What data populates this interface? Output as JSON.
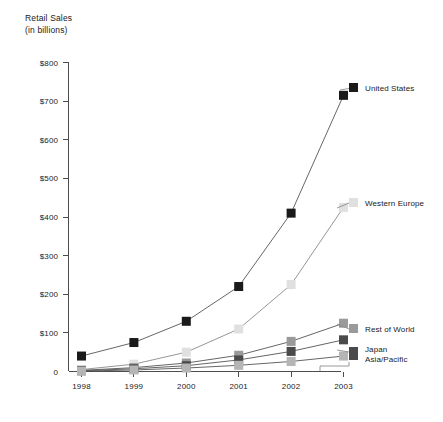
{
  "chart_data": {
    "type": "line",
    "title": "Retail Sales",
    "subtitle": "(in billions)",
    "xlabel": "",
    "ylabel": "Retail Sales (in billions)",
    "x": [
      "1998",
      "1999",
      "2000",
      "2001",
      "2002",
      "2003"
    ],
    "categories": [
      "1998",
      "1999",
      "2000",
      "2001",
      "2002",
      "2003"
    ],
    "ylim": [
      0,
      800
    ],
    "yticks": [
      0,
      100,
      200,
      300,
      400,
      500,
      600,
      700,
      800
    ],
    "ytick_labels": [
      "0",
      "$100",
      "$200",
      "$300",
      "$400",
      "$500",
      "$600",
      "$700",
      "$800"
    ],
    "grid": false,
    "legend_position": "right-inline-labels",
    "series": [
      {
        "name": "United States",
        "color": "#1a1a1a",
        "marker": "square",
        "values": [
          40,
          75,
          130,
          220,
          410,
          715
        ]
      },
      {
        "name": "Western Europe",
        "color": "#e0e0e0",
        "marker": "square",
        "values": [
          5,
          19,
          50,
          110,
          225,
          425
        ]
      },
      {
        "name": "Rest of World",
        "color": "#9a9a9a",
        "marker": "square",
        "values": [
          3,
          10,
          22,
          42,
          78,
          125
        ]
      },
      {
        "name": "Japan",
        "color": "#4a4a4a",
        "marker": "square",
        "values": [
          2,
          7,
          15,
          30,
          52,
          82
        ]
      },
      {
        "name": "Asia/Pacific",
        "color": "#b5b5b5",
        "marker": "square",
        "values": [
          1,
          4,
          9,
          16,
          26,
          40
        ]
      }
    ],
    "series_labels": [
      {
        "name": "United States",
        "line2": ""
      },
      {
        "name": "Western Europe",
        "line2": ""
      },
      {
        "name": "Rest of World",
        "line2": ""
      },
      {
        "name": "Japan",
        "line2": "Asia/Pacific"
      }
    ]
  },
  "labels": {
    "title_line1": "Retail Sales",
    "title_line2": "(in billions)",
    "us": "United States",
    "western_europe": "Western Europe",
    "rest_of_world": "Rest of World",
    "japan": "Japan",
    "asia_pacific": "Asia/Pacific"
  },
  "yticks": {
    "t0": "0",
    "t100": "$100",
    "t200": "$200",
    "t300": "$300",
    "t400": "$400",
    "t500": "$500",
    "t600": "$600",
    "t700": "$700",
    "t800": "$800"
  },
  "xticks": {
    "x1998": "1998",
    "x1999": "1999",
    "x2000": "2000",
    "x2001": "2001",
    "x2002": "2002",
    "x2003": "2003"
  },
  "colors": {
    "united_states": "#1a1a1a",
    "western_europe": "#e0e0e0",
    "rest_of_world": "#9a9a9a",
    "japan": "#4a4a4a",
    "asia_pacific": "#b5b5b5",
    "axis": "#4d4d4d",
    "text": "#1a1a1a"
  }
}
